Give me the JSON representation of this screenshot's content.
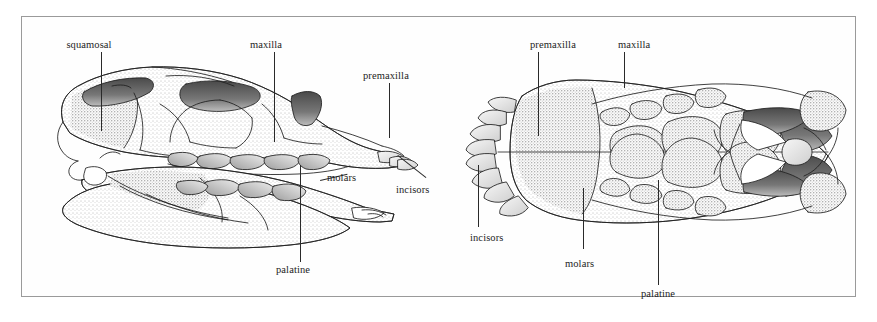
{
  "plate": {
    "background_color": "#ffffff",
    "frame_color": "#9a9a9a",
    "ink_color": "#2a2a2a",
    "figure_type": "scientific-line-illustration",
    "subject": "mammal skull, two views"
  },
  "figures": [
    {
      "name": "lateral-skull-view",
      "description": "Lateral (side) view of a skull with mandible, stippled shading",
      "labels": [
        {
          "id": "squamosal",
          "text": "squamosal"
        },
        {
          "id": "maxilla",
          "text": "maxilla"
        },
        {
          "id": "premaxilla",
          "text": "premaxilla"
        },
        {
          "id": "molars",
          "text": "molars"
        },
        {
          "id": "incisors",
          "text": "incisors"
        },
        {
          "id": "palatine",
          "text": "palatine"
        }
      ]
    },
    {
      "name": "palatal-skull-view",
      "description": "Ventral (palatal) view of a skull showing tooth rows, stippled shading",
      "labels": [
        {
          "id": "premaxilla",
          "text": "premaxilla"
        },
        {
          "id": "maxilla",
          "text": "maxilla"
        },
        {
          "id": "incisors",
          "text": "incisors"
        },
        {
          "id": "molars",
          "text": "molars"
        },
        {
          "id": "palatine",
          "text": "palatine"
        }
      ]
    }
  ]
}
